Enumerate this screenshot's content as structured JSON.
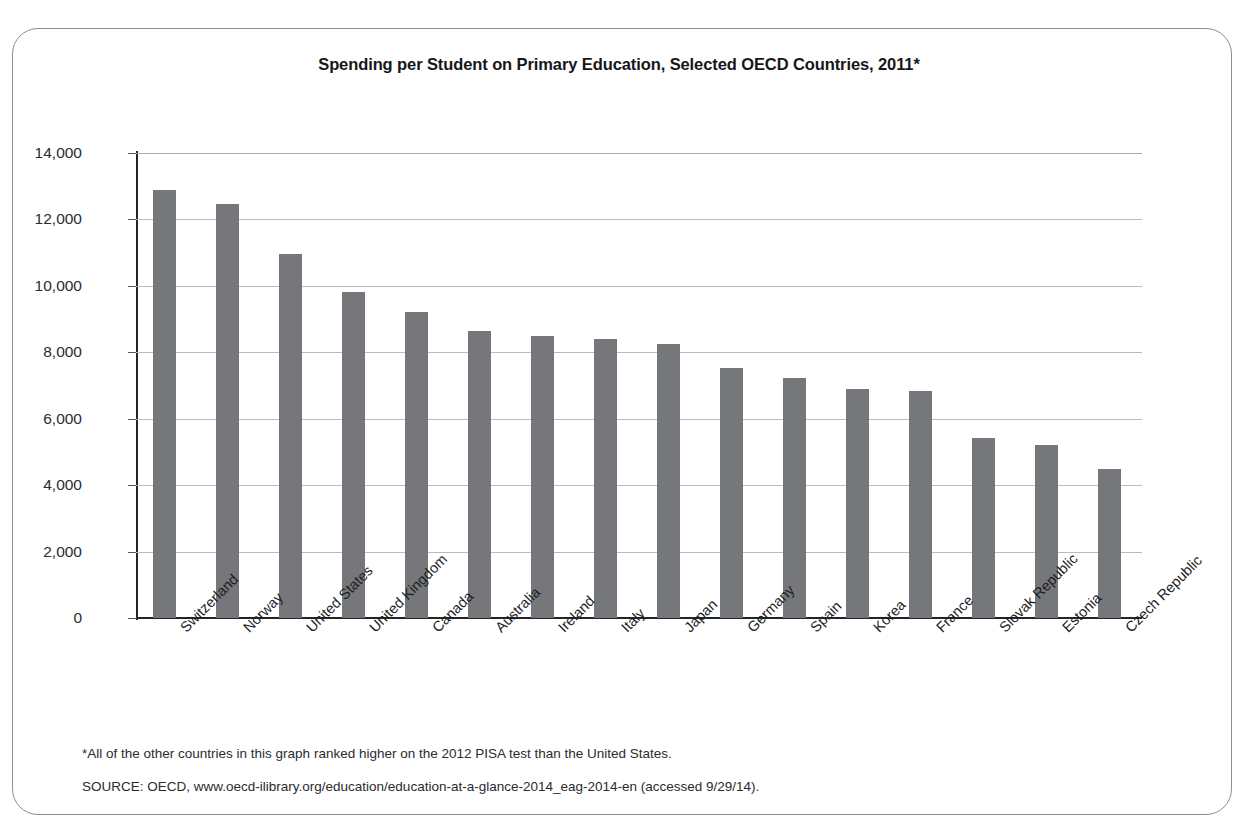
{
  "figure": {
    "title": "Spending per Student on Primary Education, Selected OECD Countries, 2011*",
    "footnote": "*All of the other countries in this graph ranked higher on the 2012 PISA test than the United States.",
    "source": "SOURCE:  OECD, www.oecd-ilibrary.org/education/education-at-a-glance-2014_eag-2014-en (accessed 9/29/14).",
    "bar_color": "#76777a",
    "gridline_color": "#b9bbbd",
    "axis_color": "#242424",
    "frame_color": "#8d8f92"
  },
  "chart_data": {
    "type": "bar",
    "title": "Spending per Student on Primary Education, Selected OECD Countries, 2011*",
    "xlabel": "",
    "ylabel": "",
    "ylim": [
      0,
      14000
    ],
    "yticks": [
      0,
      2000,
      4000,
      6000,
      8000,
      10000,
      12000,
      14000
    ],
    "ytick_labels": [
      "0",
      "2,000",
      "4,000",
      "6,000",
      "8,000",
      "10,000",
      "12,000",
      "14,000"
    ],
    "grid": true,
    "legend": false,
    "categories": [
      "Switzerland",
      "Norway",
      "United States",
      "United Kingdom",
      "Canada",
      "Australia",
      "Ireland",
      "Italy",
      "Japan",
      "Germany",
      "Spain",
      "Korea",
      "France",
      "Slovak Republic",
      "Estonia",
      "Czech Republic"
    ],
    "values": [
      12900,
      12450,
      10950,
      9830,
      9220,
      8650,
      8500,
      8400,
      8250,
      7520,
      7220,
      6900,
      6830,
      5420,
      5220,
      4480
    ]
  }
}
